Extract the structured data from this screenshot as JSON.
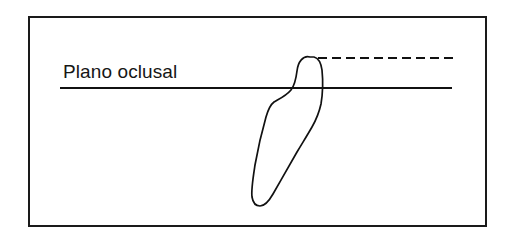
{
  "figure": {
    "kind": "dental-diagram",
    "background_color": "#ffffff",
    "frame": {
      "stroke_color": "#1a1a1a",
      "stroke_width": 2,
      "x": 28,
      "y": 16,
      "width": 459,
      "height": 211
    },
    "label": {
      "text": "Plano oclusal",
      "color": "#161616",
      "font_size": 19,
      "x": 63,
      "y": 78
    },
    "occlusal_plane_line": {
      "name": "occlusal plane",
      "color": "#111111",
      "x1": 60,
      "y1": 88,
      "x2": 452,
      "y2": 88
    },
    "dashed_reference_line": {
      "name": "reference line",
      "color": "#111111",
      "dash_length": 9,
      "gap_length": 5,
      "x1": 318,
      "y1": 58,
      "x2": 453,
      "y2": 58
    },
    "tooth_outline": {
      "name": "tooth silhouette",
      "color": "#111111",
      "stroke_width": 1.7,
      "path": "M 310 57 C 303 55 298 62 297 71 C 296 79 295 85 291 90 C 286 96 279 99 274 102 C 270 105 268 110 266 117 C 262 131 258 148 255 165 C 253 178 251 190 252 197 C 253 203 256 206 260 206 C 265 206 269 201 273 194 C 281 180 290 164 297 152 C 303 142 308 134 312 127 C 316 120 319 113 321 104 C 323 92 323 80 322 70 C 321 63 318 58 314 57 Z"
    }
  }
}
